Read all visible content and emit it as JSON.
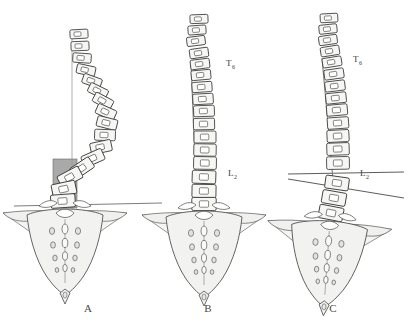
{
  "figure": {
    "type": "medical-illustration",
    "background_color": "#ffffff",
    "ink_color": "#3a3a3a",
    "bone_fill": "#f2f2f0",
    "shade_color": "#969696",
    "panel_count": 3
  },
  "panels": [
    {
      "id": "A",
      "caption": "A",
      "caption_x": 88,
      "caption_y": 312,
      "center_x": 88,
      "description": "decompensated-curve-with-shaded-translation-block",
      "has_plumb_line": true,
      "has_shaded_block": true,
      "has_reference_line": true,
      "labels": []
    },
    {
      "id": "B",
      "caption": "B",
      "caption_x": 208,
      "caption_y": 312,
      "center_x": 208,
      "description": "balanced-spine-with-t6-l2-tilt-line",
      "has_plumb_line": true,
      "has_shaded_block": false,
      "has_reference_line": false,
      "labels": [
        {
          "text": "T",
          "sub": "6",
          "x": 226,
          "y": 66
        },
        {
          "text": "L",
          "sub": "2",
          "x": 228,
          "y": 176
        }
      ]
    },
    {
      "id": "C",
      "caption": "C",
      "caption_x": 333,
      "caption_y": 312,
      "center_x": 333,
      "description": "oblique-takeoff-with-two-intersecting-reference-lines",
      "has_plumb_line": true,
      "has_shaded_block": false,
      "has_reference_line": true,
      "reference_lines": 2,
      "labels": [
        {
          "text": "T",
          "sub": "6",
          "x": 353,
          "y": 62
        },
        {
          "text": "L",
          "sub": "2",
          "x": 360,
          "y": 176
        }
      ]
    }
  ],
  "annotations": {
    "vertebra_labels": [
      "T6",
      "L2"
    ],
    "panel_letters": [
      "A",
      "B",
      "C"
    ]
  }
}
